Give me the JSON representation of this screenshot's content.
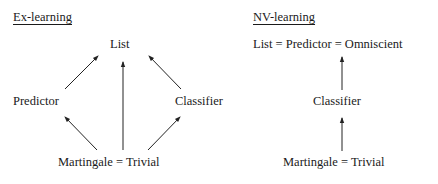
{
  "left_panel": {
    "title": "Ex-learning",
    "nodes": {
      "top": "List",
      "left": "Predictor",
      "right": "Classifier",
      "bottom": "Martingale = Trivial"
    },
    "edges": [
      {
        "from": "Martingale = Trivial",
        "to": "Predictor"
      },
      {
        "from": "Martingale = Trivial",
        "to": "List"
      },
      {
        "from": "Martingale = Trivial",
        "to": "Classifier"
      },
      {
        "from": "Predictor",
        "to": "List"
      },
      {
        "from": "Classifier",
        "to": "List"
      }
    ]
  },
  "right_panel": {
    "title": "NV-learning",
    "nodes": {
      "top": "List = Predictor = Omniscient",
      "middle": "Classifier",
      "bottom": "Martingale = Trivial"
    },
    "edges": [
      {
        "from": "Martingale = Trivial",
        "to": "Classifier"
      },
      {
        "from": "Classifier",
        "to": "List = Predictor = Omniscient"
      }
    ]
  },
  "colors": {
    "text": "#1a1a1a",
    "arrow": "#222222",
    "background": "#ffffff"
  }
}
